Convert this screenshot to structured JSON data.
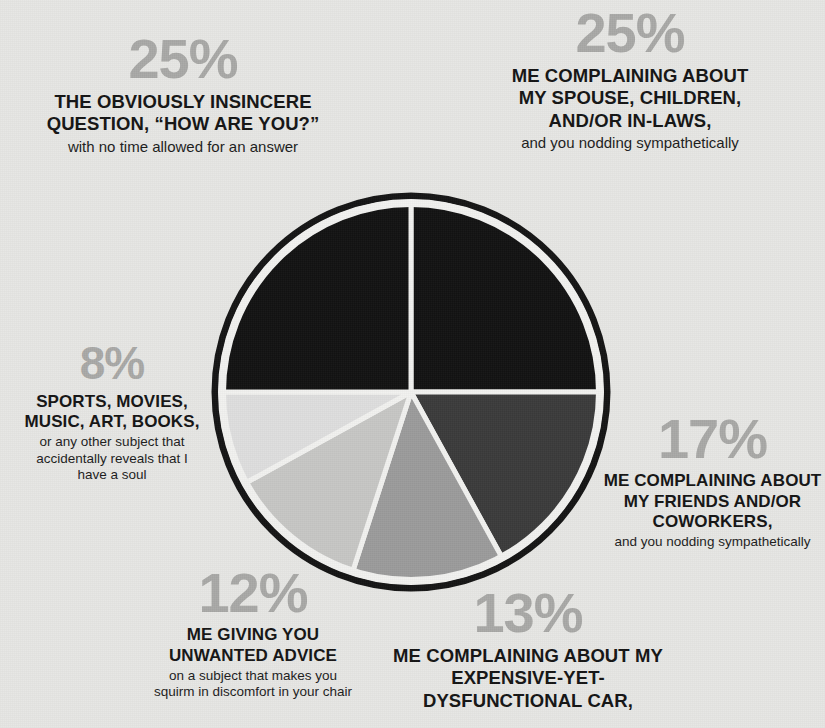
{
  "chart_data": {
    "type": "pie",
    "title": "",
    "subtitle": "",
    "xlabel": "",
    "ylabel": "",
    "legend_position": "annotations-around-pie",
    "grid": false,
    "total": 100,
    "units": "percent",
    "start_angle_deg": 0,
    "direction": "clockwise",
    "categories": [
      "ME COMPLAINING ABOUT MY SPOUSE, CHILDREN, AND/OR IN-LAWS,",
      "ME COMPLAINING ABOUT MY FRIENDS AND/OR COWORKERS,",
      "ME COMPLAINING ABOUT MY EXPENSIVE-YET-DYSFUNCTIONAL CAR,",
      "ME GIVING YOU UNWANTED ADVICE",
      "SPORTS, MOVIES, MUSIC, ART, BOOKS,",
      "THE OBVIOUSLY INSINCERE QUESTION, \"HOW ARE YOU?\""
    ],
    "values": [
      25,
      17,
      13,
      12,
      8,
      25
    ],
    "colors": [
      "#121212",
      "#3b3b3b",
      "#9b9b9b",
      "#c7c7c5",
      "#dedede",
      "#121212"
    ],
    "slices": [
      {
        "label": "spouse-children-in-laws",
        "value": 25,
        "color": "#121212",
        "start_deg": 0,
        "end_deg": 90
      },
      {
        "label": "friends-coworkers",
        "value": 17,
        "color": "#3b3b3b",
        "start_deg": 90,
        "end_deg": 151.2
      },
      {
        "label": "dysfunctional-car",
        "value": 13,
        "color": "#9b9b9b",
        "start_deg": 151.2,
        "end_deg": 198
      },
      {
        "label": "unwanted-advice",
        "value": 12,
        "color": "#c7c7c5",
        "start_deg": 198,
        "end_deg": 241.2
      },
      {
        "label": "sports-movies-music",
        "value": 8,
        "color": "#dedede",
        "start_deg": 241.2,
        "end_deg": 270
      },
      {
        "label": "insincere-question",
        "value": 25,
        "color": "#121212",
        "start_deg": 270,
        "end_deg": 360
      }
    ]
  },
  "style": {
    "background_color": "#e7e7e4",
    "percent_color": "#a9a9a7",
    "headline_color": "#141414",
    "ring_color": "#141414",
    "divider_color": "#f2f2f0"
  },
  "callouts": {
    "insincere": {
      "percent": "25%",
      "headline_line1": "THE OBVIOUSLY INSINCERE",
      "headline_line2": "QUESTION, “HOW ARE YOU?”",
      "sub": "with no time allowed for an answer"
    },
    "spouse": {
      "percent": "25%",
      "headline_line1": "ME COMPLAINING ABOUT",
      "headline_line2": "MY SPOUSE, CHILDREN,",
      "headline_line3": "AND/OR IN-LAWS,",
      "sub": "and you nodding sympathetically"
    },
    "sports": {
      "percent": "8%",
      "headline_line1": "SPORTS, MOVIES,",
      "headline_line2": "MUSIC, ART, BOOKS,",
      "sub_line1": "or any other subject that",
      "sub_line2": "accidentally reveals that I",
      "sub_line3": "have a soul"
    },
    "friends": {
      "percent": "17%",
      "headline_line1": "ME COMPLAINING ABOUT",
      "headline_line2": "MY FRIENDS AND/OR",
      "headline_line3": "COWORKERS,",
      "sub": "and you nodding sympathetically"
    },
    "advice": {
      "percent": "12%",
      "headline_line1": "ME GIVING YOU",
      "headline_line2": "UNWANTED ADVICE",
      "sub_line1": "on a subject that makes you",
      "sub_line2": "squirm in discomfort in your chair"
    },
    "car": {
      "percent": "13%",
      "headline_line1": "ME COMPLAINING ABOUT MY",
      "headline_line2": "EXPENSIVE-YET-DYSFUNCTIONAL CAR,"
    }
  }
}
